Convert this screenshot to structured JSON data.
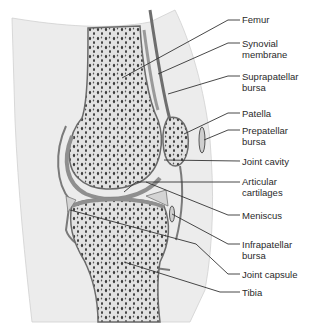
{
  "diagram": {
    "labels": [
      {
        "id": "femur",
        "lines": [
          "Femur"
        ],
        "top": 14
      },
      {
        "id": "synovial-membrane",
        "lines": [
          "Synovial",
          "membrane"
        ],
        "top": 38
      },
      {
        "id": "suprapatellar-bursa",
        "lines": [
          "Suprapatellar",
          "bursa"
        ],
        "top": 71
      },
      {
        "id": "patella",
        "lines": [
          "Patella"
        ],
        "top": 108
      },
      {
        "id": "prepatellar-bursa",
        "lines": [
          "Prepatellar",
          "bursa"
        ],
        "top": 125
      },
      {
        "id": "joint-cavity",
        "lines": [
          "Joint cavity"
        ],
        "top": 156
      },
      {
        "id": "articular-cartilages",
        "lines": [
          "Articular",
          "cartilages"
        ],
        "top": 175
      },
      {
        "id": "meniscus",
        "lines": [
          "Meniscus"
        ],
        "top": 210
      },
      {
        "id": "infrapatellar-bursa",
        "lines": [
          "Infrapatellar",
          "bursa"
        ],
        "top": 237
      },
      {
        "id": "joint-capsule",
        "lines": [
          "Joint capsule"
        ],
        "top": 269
      },
      {
        "id": "tibia",
        "lines": [
          "Tibia"
        ],
        "top": 286
      }
    ],
    "colors": {
      "bone_outline": "#5a5a5a",
      "bone_fill": "#d9d9d9",
      "cartilage": "#8f8f8f",
      "soft_tissue": "#ececec",
      "leader_line": "#333333",
      "text": "#2a2a2a"
    }
  }
}
